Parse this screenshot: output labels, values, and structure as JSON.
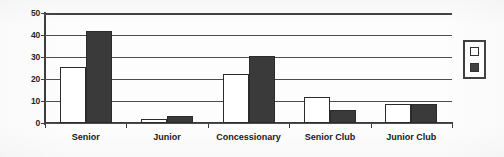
{
  "chart_data": {
    "type": "bar",
    "title": "",
    "subtitle": "",
    "xlabel": "",
    "ylabel": "",
    "ylim": [
      0,
      50
    ],
    "yticks": [
      0,
      10,
      20,
      30,
      40,
      50
    ],
    "grid": "horizontal",
    "legend_position": "right-outside",
    "categories": [
      "Senior",
      "Junior",
      "Concessionary",
      "Senior Club",
      "Junior Club"
    ],
    "series": [
      {
        "name": "series-1",
        "label": "",
        "color": "#ffffff",
        "edge_color": "#2b2b2b",
        "marker": "open-square",
        "values": [
          25.5,
          2,
          22.5,
          12,
          8.5
        ]
      },
      {
        "name": "series-2",
        "label": "",
        "color": "#3a3a3a",
        "edge_color": "#2b2b2b",
        "marker": "filled-square",
        "values": [
          42,
          3,
          30.5,
          6,
          8.5
        ]
      }
    ],
    "annotations": []
  },
  "axis": {
    "y_tick_labels": [
      "0",
      "10",
      "20",
      "30",
      "40",
      "50"
    ],
    "x_tick_labels": [
      "Senior",
      "Junior",
      "Concessionary",
      "Senior Club",
      "Junior Club"
    ]
  },
  "legend": {
    "swatch_a_name": "open-square-swatch",
    "swatch_b_name": "filled-square-swatch"
  },
  "colors": {
    "series_a": "#ffffff",
    "series_b": "#3a3a3a",
    "axis": "#3a3a3a",
    "grid": "#4d4d4d",
    "text": "#111111",
    "background": "#fdfdfd"
  }
}
